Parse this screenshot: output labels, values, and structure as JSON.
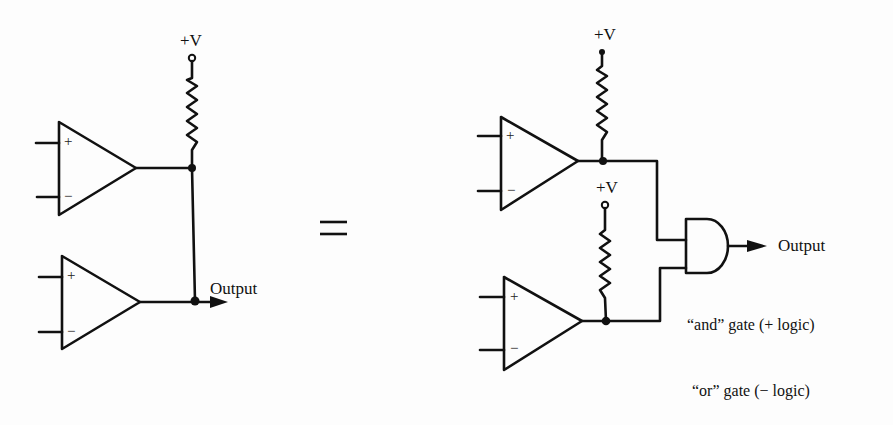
{
  "diagram": {
    "left": {
      "supply_label": "+V",
      "output_label": "Output",
      "opamps": [
        {
          "plus": "+",
          "minus": "−"
        },
        {
          "plus": "+",
          "minus": "−"
        }
      ]
    },
    "equals_sign": "=",
    "right": {
      "supply_labels": [
        "+V",
        "+V"
      ],
      "output_label": "Output",
      "opamps": [
        {
          "plus": "+",
          "minus": "−"
        },
        {
          "plus": "+",
          "minus": "−"
        }
      ],
      "gate_type": "and-gate",
      "captions": [
        "“and” gate (+ logic)",
        "“or” gate (− logic)"
      ]
    }
  }
}
